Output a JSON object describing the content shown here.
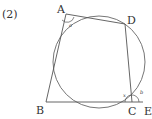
{
  "problem_number": "(2)",
  "points": {
    "A": {
      "label": "A"
    },
    "B": {
      "label": "B"
    },
    "C": {
      "label": "C"
    },
    "D": {
      "label": "D"
    },
    "E": {
      "label": "E"
    }
  },
  "angles": {
    "a": "a",
    "x": "x",
    "b": "b"
  },
  "colors": {
    "stroke": "#555555",
    "text": "#333333"
  }
}
